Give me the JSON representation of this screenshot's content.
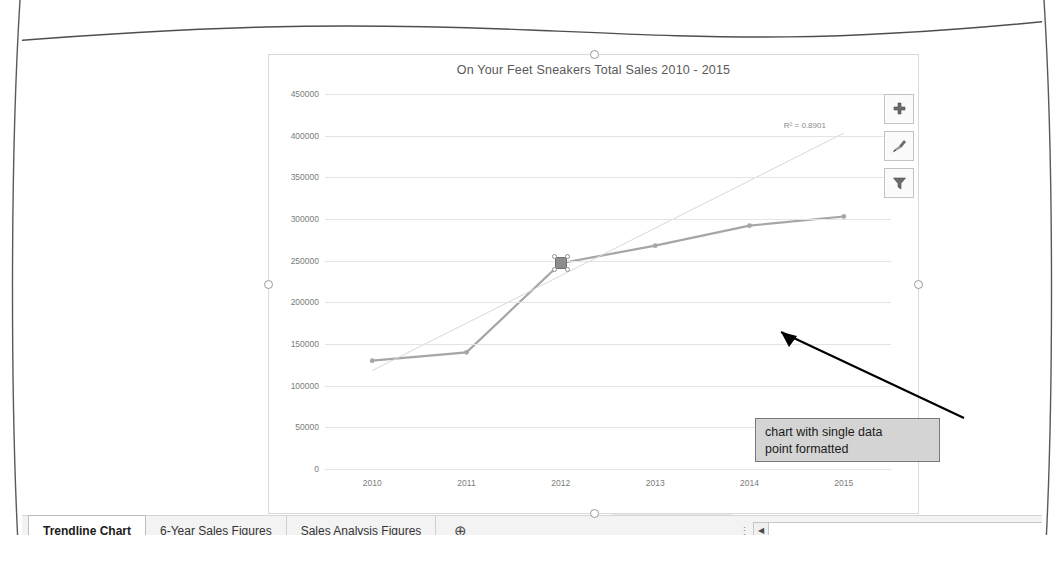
{
  "app": {
    "formula_bar": {
      "fx_icon": "fx-icon",
      "formula_left": "=SERIES(",
      "formula_right": "gures !$B$4:$G$4, 6"
    }
  },
  "chart": {
    "title": "On Your Feet Sneakers Total Sales 2010 - 2015",
    "r2_label": "R² = 0.8901",
    "buttons": [
      {
        "name": "chart-elements-button",
        "icon": "plus-icon",
        "glyph": "✚"
      },
      {
        "name": "chart-styles-button",
        "icon": "paintbrush-icon",
        "glyph": "🖌"
      },
      {
        "name": "chart-filters-button",
        "icon": "funnel-icon",
        "glyph": "▼"
      }
    ],
    "callout": {
      "line1": "chart with single data",
      "line2": "point formatted"
    },
    "selected_point": {
      "category": "2012",
      "value": 247000
    }
  },
  "chart_data": {
    "type": "line",
    "title": "On Your Feet Sneakers Total Sales 2010 - 2015",
    "xlabel": "",
    "ylabel": "",
    "categories": [
      "2010",
      "2011",
      "2012",
      "2013",
      "2014",
      "2015"
    ],
    "values": [
      130000,
      140000,
      247000,
      268000,
      292000,
      303000
    ],
    "series": [
      {
        "name": "Total Sales",
        "values": [
          130000,
          140000,
          247000,
          268000,
          292000,
          303000
        ],
        "color": "#a6a6a6"
      },
      {
        "name": "Linear Trendline",
        "type": "trendline",
        "values": [
          118000,
          175000,
          232000,
          289000,
          346000,
          403000
        ],
        "color": "#d8d8d8",
        "r_squared": 0.8901
      }
    ],
    "ylim": [
      0,
      450000
    ],
    "yticks": [
      0,
      50000,
      100000,
      150000,
      200000,
      250000,
      300000,
      350000,
      400000,
      450000
    ],
    "ytick_labels": [
      "0",
      "50000",
      "100000",
      "150000",
      "200000",
      "250000",
      "300000",
      "350000",
      "400000",
      "450000"
    ],
    "grid": true,
    "legend": false
  },
  "tabs": {
    "items": [
      {
        "label": "Trendline Chart",
        "active": true
      },
      {
        "label": "6-Year Sales Figures",
        "active": false
      },
      {
        "label": "Sales Analysis Figures",
        "active": false
      }
    ],
    "add_label": "⊕",
    "overflow_dots": "⋮"
  },
  "status": {
    "scroll_left_glyph": "◀",
    "grid_icon": "grid-icon"
  }
}
